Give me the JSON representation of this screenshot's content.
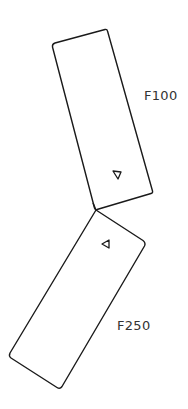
{
  "diagram": {
    "parts": [
      {
        "id": "F100",
        "label": "F100",
        "shape": "rotated-rectangle",
        "corners": [
          [
            53,
            44
          ],
          [
            107,
            29
          ],
          [
            152,
            193
          ],
          [
            95,
            210
          ]
        ],
        "orientation_marker": {
          "shape": "triangle",
          "position": [
            117,
            175
          ]
        }
      },
      {
        "id": "F250",
        "label": "F250",
        "shape": "rotated-rectangle",
        "corners": [
          [
            96,
            210
          ],
          [
            146,
            243
          ],
          [
            60,
            389
          ],
          [
            9,
            356
          ]
        ],
        "orientation_marker": {
          "shape": "triangle",
          "position": [
            106,
            244
          ]
        }
      }
    ],
    "connection": {
      "point": [
        96,
        210
      ],
      "description": "rectangles meet at shared corner"
    }
  },
  "colors": {
    "stroke": "#1a1a1a",
    "label": "#333333",
    "background": "#ffffff"
  }
}
